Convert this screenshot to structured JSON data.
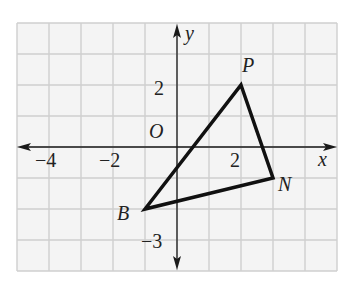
{
  "diagram": {
    "type": "coordinate-grid",
    "grid": {
      "x_min": -5,
      "x_max": 5,
      "y_min": -4,
      "y_max": 4,
      "origin_px": [
        177,
        147
      ],
      "unit_px_x": 32,
      "unit_px_y": 31,
      "background": "#f4f4f4",
      "line_color": "#cfcfcf"
    },
    "axes": {
      "x_label": "x",
      "y_label": "y",
      "origin_label": "O",
      "color": "#1a1a1a"
    },
    "tick_labels": {
      "x": [
        {
          "value": -4,
          "text": "−4"
        },
        {
          "value": -2,
          "text": "−2"
        },
        {
          "value": 2,
          "text": "2"
        }
      ],
      "y": [
        {
          "value": 2,
          "text": "2"
        },
        {
          "value": -3,
          "text": "−3"
        }
      ]
    },
    "triangle": {
      "stroke": "#111111",
      "vertices": [
        {
          "name": "P",
          "x": 2,
          "y": 2
        },
        {
          "name": "N",
          "x": 3,
          "y": -1
        },
        {
          "name": "B",
          "x": -1,
          "y": -2
        }
      ]
    }
  }
}
